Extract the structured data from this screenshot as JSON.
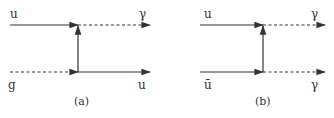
{
  "diagrams": [
    {
      "caption": "(a)",
      "labels": {
        "top_left": "u",
        "top_right": "γ",
        "bottom_left": "g",
        "bottom_right": "u"
      },
      "lines": {
        "top_left": "fermion",
        "top_right": "photon",
        "bottom_left": "gluon",
        "bottom_right": "fermion",
        "propagator": "fermion"
      }
    },
    {
      "caption": "(b)",
      "labels": {
        "top_left": "u",
        "top_right": "γ",
        "bottom_left": "ū",
        "bottom_right": "γ"
      },
      "lines": {
        "top_left": "fermion",
        "top_right": "photon",
        "bottom_left": "fermion",
        "bottom_right": "photon",
        "propagator": "fermion"
      }
    }
  ],
  "colors": {
    "line": "#333333"
  }
}
